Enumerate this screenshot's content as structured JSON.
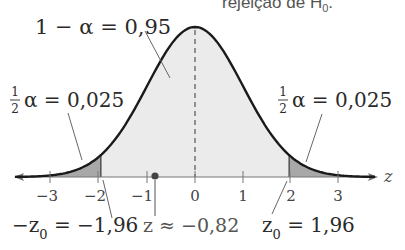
{
  "header": {
    "caption_fragment": "rejeição de H",
    "caption_subscript": "0",
    "caption_end": "."
  },
  "labels": {
    "center_area": "1 − α = 0,95",
    "left_tail_frac_num": "1",
    "left_tail_frac_den": "2",
    "left_tail_rest": "α = 0,025",
    "right_tail_frac_num": "1",
    "right_tail_frac_den": "2",
    "right_tail_rest": "α = 0,025",
    "neg_z0_prefix": "−z",
    "neg_z0_sub": "0",
    "neg_z0_value": " = −1,96",
    "z_stat": "z ≈ −0,82",
    "pos_z0_prefix": "z",
    "pos_z0_sub": "0",
    "pos_z0_value": " = 1,96",
    "axis_variable": "z"
  },
  "axis": {
    "ticks": [
      "−3",
      "−2",
      "−1",
      "0",
      "1",
      "2",
      "3"
    ]
  },
  "colors": {
    "curve": "#1a1a1a",
    "center_fill": "#ebebeb",
    "tail_fill": "#a8a8a8",
    "axis": "#777777",
    "text": "#2a2a2a",
    "dot": "#444444"
  },
  "chart_data": {
    "type": "area",
    "title": "",
    "distribution": "standard normal",
    "xlabel": "z",
    "x_range": [
      -3.5,
      3.5
    ],
    "x_ticks": [
      -3,
      -2,
      -1,
      0,
      1,
      2,
      3
    ],
    "critical_values": [
      -1.96,
      1.96
    ],
    "test_statistic": -0.82,
    "regions": [
      {
        "name": "left rejection tail",
        "from": -3.5,
        "to": -1.96,
        "area": 0.025
      },
      {
        "name": "non-rejection",
        "from": -1.96,
        "to": 1.96,
        "area": 0.95
      },
      {
        "name": "right rejection tail",
        "from": 1.96,
        "to": 3.5,
        "area": 0.025
      }
    ],
    "alpha": 0.05,
    "mean_line": 0
  }
}
